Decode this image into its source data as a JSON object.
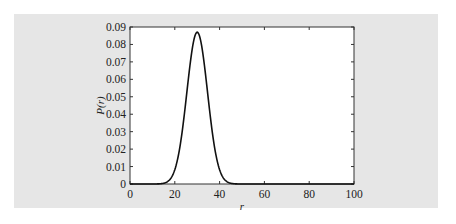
{
  "colors": {
    "panel_background": "#e6e6e6",
    "plot_background": "#ffffff",
    "axis": "#333333",
    "curve": "#111111"
  },
  "chart_data": {
    "type": "line",
    "title": "",
    "xlabel": "r",
    "ylabel": "P(r)",
    "xlim": [
      0,
      100
    ],
    "ylim": [
      0,
      0.09
    ],
    "xticks": [
      0,
      20,
      40,
      60,
      80,
      100
    ],
    "xtick_labels": [
      "0",
      "20",
      "40",
      "60",
      "80",
      "100"
    ],
    "yticks": [
      0,
      0.01,
      0.02,
      0.03,
      0.04,
      0.05,
      0.06,
      0.07,
      0.08,
      0.09
    ],
    "ytick_labels": [
      "0",
      "0.01",
      "0.02",
      "0.03",
      "0.04",
      "0.05",
      "0.06",
      "0.07",
      "0.08",
      "0.09"
    ],
    "grid": false,
    "legend": null,
    "series": [
      {
        "name": "P(r)",
        "x": [
          0,
          10,
          14,
          16,
          18,
          20,
          22,
          24,
          26,
          28,
          29,
          30,
          31,
          32,
          34,
          36,
          38,
          40,
          42,
          44,
          46,
          48,
          50,
          60,
          80,
          100
        ],
        "y": [
          0,
          0.0001,
          0.0008,
          0.0024,
          0.006,
          0.0132,
          0.025,
          0.0416,
          0.0598,
          0.0774,
          0.0836,
          0.0867,
          0.0836,
          0.0774,
          0.0598,
          0.0416,
          0.025,
          0.0132,
          0.006,
          0.0024,
          0.0008,
          0.0002,
          0.0001,
          0,
          0,
          0
        ]
      }
    ],
    "peak": {
      "x": 30,
      "y": 0.087
    },
    "distribution_shape": "bell-shaped, approx. mean 30, std 4.6"
  }
}
